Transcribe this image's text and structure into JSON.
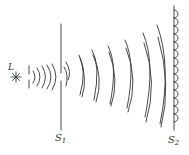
{
  "diagram": {
    "type": "wave-diffraction-huygens",
    "source": {
      "label": "L",
      "icon": "light-source-star-icon"
    },
    "screens": [
      {
        "label_main": "S",
        "label_sub": "1",
        "x": 61
      },
      {
        "label_main": "S",
        "label_sub": "2",
        "x": 174
      }
    ],
    "colors": {
      "stroke": "#333333",
      "background": "#ffffff"
    }
  }
}
